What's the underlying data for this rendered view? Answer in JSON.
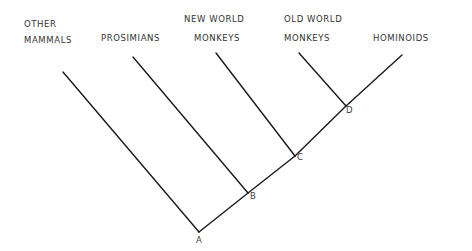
{
  "diagram": {
    "type": "cladogram",
    "taxa": [
      {
        "id": "other",
        "line1": "OTHER",
        "line2": "MAMMALS"
      },
      {
        "id": "prosimians",
        "line1": "",
        "line2": "PROSIMIANS"
      },
      {
        "id": "nwm",
        "line1": "NEW WORLD",
        "line2": "MONKEYS"
      },
      {
        "id": "owm",
        "line1": "OLD WORLD",
        "line2": "MONKEYS"
      },
      {
        "id": "hominoids",
        "line1": "",
        "line2": "HOMINOIDS"
      }
    ],
    "nodes": [
      {
        "id": "A",
        "label": "A"
      },
      {
        "id": "B",
        "label": "B"
      },
      {
        "id": "C",
        "label": "C"
      },
      {
        "id": "D",
        "label": "D"
      }
    ],
    "edges": [
      {
        "from": "A",
        "to": "other"
      },
      {
        "from": "A",
        "to": "B"
      },
      {
        "from": "B",
        "to": "prosimians"
      },
      {
        "from": "B",
        "to": "C"
      },
      {
        "from": "C",
        "to": "nwm"
      },
      {
        "from": "C",
        "to": "D"
      },
      {
        "from": "D",
        "to": "owm"
      },
      {
        "from": "D",
        "to": "hominoids"
      }
    ]
  }
}
